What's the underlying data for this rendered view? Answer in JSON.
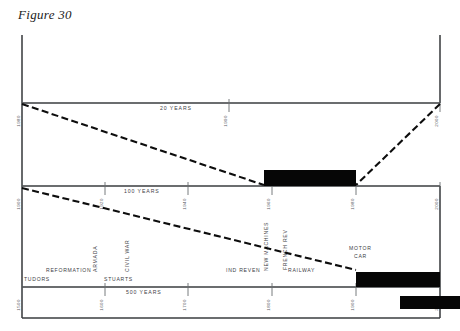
{
  "figure": {
    "title": "Figure 30",
    "canvas": {
      "width": 460,
      "height": 331
    },
    "colors": {
      "background": "#ffffff",
      "axis": "#55585c",
      "spine": "#35373a",
      "bar": "#060606",
      "connector": "#0d0d0d",
      "text": "#4a4d51"
    }
  },
  "tiers": [
    {
      "id": "tier-20-years",
      "span_label": "20 YEARS",
      "axis_y": 103,
      "x_start": 22,
      "x_end": 440,
      "range": [
        1980,
        2000
      ],
      "ticks": [
        {
          "year": "1980",
          "x": 22
        },
        {
          "year": "1990",
          "x": 229
        },
        {
          "year": "2000",
          "x": 440
        }
      ],
      "bars": [],
      "era_labels": []
    },
    {
      "id": "tier-100-years",
      "span_label": "100 YEARS",
      "axis_y": 186,
      "x_start": 22,
      "x_end": 440,
      "range": [
        1900,
        2000
      ],
      "ticks": [
        {
          "year": "1900",
          "x": 22
        },
        {
          "year": "1920",
          "x": 105
        },
        {
          "year": "1940",
          "x": 188
        },
        {
          "year": "1960",
          "x": 272
        },
        {
          "year": "1980",
          "x": 356
        },
        {
          "year": "2000",
          "x": 440
        }
      ],
      "bars": [
        {
          "x": 264,
          "width": 92,
          "height": 16,
          "from": "1960",
          "to": "1980"
        }
      ],
      "era_labels": []
    },
    {
      "id": "tier-500-years",
      "span_label": "500 YEARS",
      "axis_y": 287,
      "x_start": 22,
      "x_end": 440,
      "range": [
        1500,
        2000
      ],
      "ticks": [
        {
          "year": "1500",
          "x": 22
        },
        {
          "year": "1600",
          "x": 105
        },
        {
          "year": "1700",
          "x": 188
        },
        {
          "year": "1800",
          "x": 272
        },
        {
          "year": "1900",
          "x": 356
        },
        {
          "year": "2000",
          "x": 440
        }
      ],
      "bars": [
        {
          "x": 356,
          "width": 84,
          "height": 15,
          "from": "1900",
          "to": "2000"
        }
      ],
      "era_labels": [
        {
          "text": "TUDORS",
          "x": 24,
          "y": 280,
          "rotate": 0
        },
        {
          "text": "REFORMATION",
          "x": 48,
          "y": 272,
          "rotate": 0
        },
        {
          "text": "ARMADA",
          "x": 95,
          "y": 272,
          "rotate": -90
        },
        {
          "text": "CIVIL WAR",
          "x": 127,
          "y": 272,
          "rotate": -90
        },
        {
          "text": "STUARTS",
          "x": 105,
          "y": 280,
          "rotate": 0
        },
        {
          "text": "IND REVEN",
          "x": 228,
          "y": 272,
          "rotate": 0
        },
        {
          "text": "NEW MACHINES",
          "x": 265,
          "y": 272,
          "rotate": -90
        },
        {
          "text": "FRENCH REV",
          "x": 283,
          "y": 270,
          "rotate": -90
        },
        {
          "text": "RAILWAY",
          "x": 289,
          "y": 272,
          "rotate": 0
        },
        {
          "text": "MOTOR",
          "x": 350,
          "y": 250,
          "rotate": 0
        },
        {
          "text": "CAR",
          "x": 355,
          "y": 258,
          "rotate": 0
        }
      ]
    }
  ],
  "overflow_bar": {
    "x": 400,
    "y": 296,
    "width": 60,
    "height": 13
  },
  "connectors": [
    {
      "id": "connector-left-upper",
      "x1": 22,
      "y1": 104,
      "x2": 264,
      "y2": 185
    },
    {
      "id": "connector-right-upper",
      "x1": 440,
      "y1": 104,
      "x2": 356,
      "y2": 185
    },
    {
      "id": "connector-left-lower",
      "x1": 22,
      "y1": 188,
      "x2": 356,
      "y2": 270
    }
  ],
  "frame": {
    "left_spine": {
      "x": 22,
      "y1": 35,
      "y2": 318
    },
    "right_stub": {
      "x": 440,
      "y1": 35,
      "y2": 103
    },
    "bottom_rule": {
      "y": 318,
      "x1": 22,
      "x2": 440
    },
    "right_lower": {
      "x": 440,
      "y1": 186,
      "y2": 318
    }
  }
}
